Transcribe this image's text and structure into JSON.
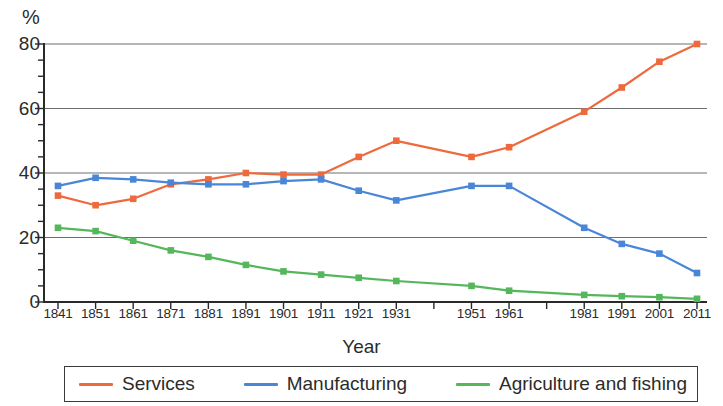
{
  "chart_data": {
    "type": "line",
    "title": "",
    "xlabel": "Year",
    "ylabel": "%",
    "ylim": [
      0,
      80
    ],
    "yticks": [
      0,
      20,
      40,
      60,
      80
    ],
    "yticks_minor_step": 5,
    "grid": "horizontal",
    "legend_position": "bottom",
    "categories": [
      "1841",
      "1851",
      "1861",
      "1871",
      "1881",
      "1891",
      "1901",
      "1911",
      "1921",
      "1931",
      "1941",
      "1951",
      "1961",
      "1971",
      "1981",
      "1991",
      "2001",
      "2011"
    ],
    "tick_labels": [
      "1841",
      "1851",
      "1861",
      "1871",
      "1881",
      "1891",
      "1901",
      "1911",
      "1921",
      "1931",
      "",
      "1951",
      "1961",
      "",
      "1981",
      "1991",
      "2001",
      "2011"
    ],
    "series": [
      {
        "name": "Services",
        "color": "#ee6a3c",
        "values": [
          33,
          30,
          32,
          36.5,
          38,
          40,
          39.5,
          39.5,
          45,
          50,
          null,
          45,
          48,
          null,
          59,
          66.5,
          74.5,
          80
        ]
      },
      {
        "name": "Manufacturing",
        "color": "#4a86d8",
        "values": [
          36,
          38.5,
          38,
          37,
          36.5,
          36.5,
          37.5,
          38,
          34.5,
          31.5,
          null,
          36,
          36,
          null,
          23,
          18,
          15,
          9
        ]
      },
      {
        "name": "Agriculture and fishing",
        "color": "#55b75b",
        "values": [
          23,
          22,
          19,
          16,
          14,
          11.5,
          9.5,
          8.5,
          7.5,
          6.5,
          null,
          5,
          3.5,
          null,
          2.2,
          1.8,
          1.5,
          1
        ]
      }
    ]
  },
  "axes": {
    "y_unit": "%",
    "x_title": "Year"
  },
  "legend": {
    "items": [
      {
        "label": "Services",
        "color": "#ee6a3c"
      },
      {
        "label": "Manufacturing",
        "color": "#4a86d8"
      },
      {
        "label": "Agriculture and fishing",
        "color": "#55b75b"
      }
    ]
  }
}
